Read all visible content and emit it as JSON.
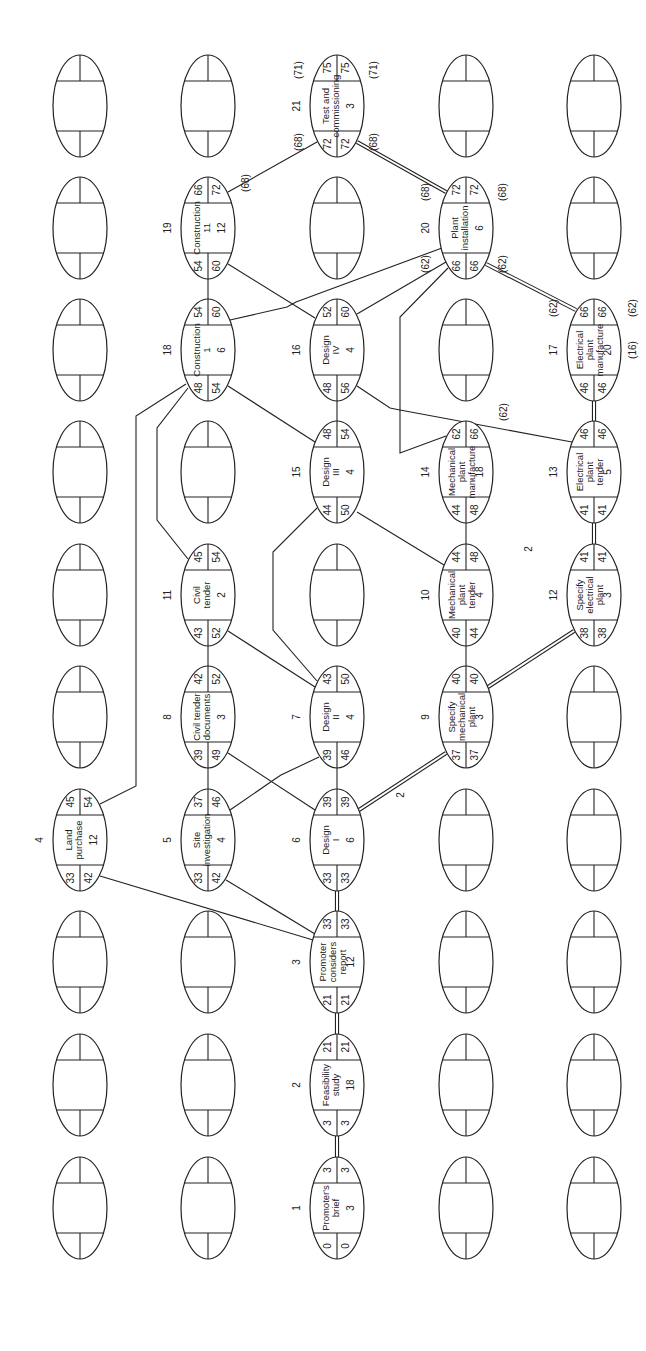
{
  "grid": {
    "columns_x": [
      80,
      208,
      337,
      466,
      594
    ],
    "rows_y": [
      106,
      228,
      350,
      472,
      595,
      717,
      840,
      962,
      1085,
      1208
    ],
    "node_rx": 27,
    "node_ry": 51
  },
  "nodes": [
    {
      "id": "1",
      "name": [
        "Promoter's",
        "brief"
      ],
      "duration": "3",
      "es": "0",
      "ls": "0",
      "ef": "3",
      "lf": "3",
      "col": 2,
      "row": 9
    },
    {
      "id": "2",
      "name": [
        "Feasibility",
        "study"
      ],
      "duration": "18",
      "es": "3",
      "ls": "3",
      "ef": "21",
      "lf": "21",
      "col": 2,
      "row": 8
    },
    {
      "id": "3",
      "name": [
        "Promoter",
        "considers",
        "report"
      ],
      "duration": "12",
      "es": "21",
      "ls": "21",
      "ef": "33",
      "lf": "33",
      "col": 2,
      "row": 7
    },
    {
      "id": "4",
      "name": [
        "Land",
        "purchase"
      ],
      "duration": "12",
      "es": "33",
      "ls": "42",
      "ef": "45",
      "lf": "54",
      "col": 0,
      "row": 6
    },
    {
      "id": "5",
      "name": [
        "Site",
        "investigation"
      ],
      "duration": "4",
      "es": "33",
      "ls": "42",
      "ef": "37",
      "lf": "46",
      "col": 1,
      "row": 6
    },
    {
      "id": "6",
      "name": [
        "Design",
        "I"
      ],
      "duration": "6",
      "es": "33",
      "ls": "33",
      "ef": "39",
      "lf": "39",
      "col": 2,
      "row": 6
    },
    {
      "id": "7",
      "name": [
        "Design",
        "II"
      ],
      "duration": "4",
      "es": "39",
      "ls": "46",
      "ef": "43",
      "lf": "50",
      "col": 2,
      "row": 5
    },
    {
      "id": "8",
      "name": [
        "Civil tender",
        "documents"
      ],
      "duration": "3",
      "es": "39",
      "ls": "49",
      "ef": "42",
      "lf": "52",
      "col": 1,
      "row": 5
    },
    {
      "id": "9",
      "name": [
        "Specify",
        "mechanical",
        "plant"
      ],
      "duration": "3",
      "es": "37",
      "ls": "37",
      "ef": "40",
      "lf": "40",
      "col": 3,
      "row": 5
    },
    {
      "id": "10",
      "name": [
        "Mechanical",
        "plant",
        "tender"
      ],
      "duration": "4",
      "es": "40",
      "ls": "44",
      "ef": "44",
      "lf": "48",
      "col": 3,
      "row": 4
    },
    {
      "id": "11",
      "name": [
        "Civil",
        "tender"
      ],
      "duration": "2",
      "es": "43",
      "ls": "52",
      "ef": "45",
      "lf": "54",
      "col": 1,
      "row": 4
    },
    {
      "id": "12",
      "name": [
        "Specify",
        "electrical",
        "plant"
      ],
      "duration": "3",
      "es": "38",
      "ls": "38",
      "ef": "41",
      "lf": "41",
      "col": 4,
      "row": 4
    },
    {
      "id": "13",
      "name": [
        "Electrical",
        "plant",
        "tender"
      ],
      "duration": "5",
      "es": "41",
      "ls": "41",
      "ef": "46",
      "lf": "46",
      "col": 4,
      "row": 3
    },
    {
      "id": "14",
      "name": [
        "Mechanical",
        "plant",
        "manufacture"
      ],
      "duration": "18",
      "es": "44",
      "ls": "48",
      "ef": "62",
      "lf": "66",
      "col": 3,
      "row": 3,
      "float_note": "(62)"
    },
    {
      "id": "15",
      "name": [
        "Design",
        "III"
      ],
      "duration": "4",
      "es": "44",
      "ls": "50",
      "ef": "48",
      "lf": "54",
      "col": 2,
      "row": 3
    },
    {
      "id": "16",
      "name": [
        "Design",
        "IV"
      ],
      "duration": "4",
      "es": "48",
      "ls": "56",
      "ef": "52",
      "lf": "60",
      "col": 2,
      "row": 2
    },
    {
      "id": "17",
      "name": [
        "Electrical",
        "plant",
        "manufacture"
      ],
      "duration": "20",
      "es": "46",
      "ls": "46",
      "ef": "66",
      "lf": "66",
      "col": 4,
      "row": 2,
      "notes": [
        "(62)",
        "(62)",
        "(16)"
      ]
    },
    {
      "id": "18",
      "name": [
        "Construction",
        "1"
      ],
      "duration": "6",
      "es": "48",
      "ls": "54",
      "ef": "54",
      "lf": "60",
      "col": 1,
      "row": 2
    },
    {
      "id": "19",
      "name": [
        "Construction",
        "11"
      ],
      "duration": "12",
      "es": "54",
      "ls": "60",
      "ef": "66",
      "lf": "72",
      "col": 1,
      "row": 1,
      "notes": [
        "(68)"
      ]
    },
    {
      "id": "20",
      "name": [
        "Plant",
        "installation"
      ],
      "duration": "6",
      "es": "66",
      "ls": "66",
      "ef": "72",
      "lf": "72",
      "col": 3,
      "row": 1,
      "notes": [
        "(62)",
        "(68)",
        "(62)",
        "(68)"
      ]
    },
    {
      "id": "21",
      "name": [
        "Test and",
        "commissioning"
      ],
      "duration": "3",
      "es": "72",
      "ls": "72",
      "ef": "75",
      "lf": "75",
      "col": 2,
      "row": 0,
      "notes": [
        "(68)",
        "(71)",
        "(68)",
        "(71)"
      ]
    }
  ],
  "edges": [
    {
      "from": "1",
      "to": "2",
      "critical": true
    },
    {
      "from": "2",
      "to": "3",
      "critical": true
    },
    {
      "from": "3",
      "to": "4",
      "critical": false
    },
    {
      "from": "3",
      "to": "5",
      "critical": false
    },
    {
      "from": "3",
      "to": "6",
      "critical": true
    },
    {
      "from": "6",
      "to": "9",
      "critical": true,
      "label": "2"
    },
    {
      "from": "6",
      "to": "7",
      "critical": false
    },
    {
      "from": "6",
      "to": "8",
      "critical": false
    },
    {
      "from": "5",
      "to": "8",
      "critical": false
    },
    {
      "from": "5",
      "to": "7",
      "critical": false
    },
    {
      "from": "8",
      "to": "11",
      "critical": false
    },
    {
      "from": "7",
      "to": "11",
      "critical": false
    },
    {
      "from": "7",
      "to": "15",
      "critical": false
    },
    {
      "from": "9",
      "to": "10",
      "critical": false
    },
    {
      "from": "9",
      "to": "12",
      "critical": true,
      "label": "2"
    },
    {
      "from": "10",
      "to": "14",
      "critical": false
    },
    {
      "from": "15",
      "to": "10",
      "critical": false
    },
    {
      "from": "12",
      "to": "13",
      "critical": true
    },
    {
      "from": "13",
      "to": "17",
      "critical": true
    },
    {
      "from": "15",
      "to": "16",
      "critical": false
    },
    {
      "from": "15",
      "to": "18",
      "critical": false
    },
    {
      "from": "11",
      "to": "18",
      "critical": false
    },
    {
      "from": "4",
      "to": "18",
      "critical": false
    },
    {
      "from": "16",
      "to": "13",
      "critical": false
    },
    {
      "from": "16",
      "to": "19",
      "critical": false
    },
    {
      "from": "16",
      "to": "20",
      "critical": false
    },
    {
      "from": "18",
      "to": "19",
      "critical": false
    },
    {
      "from": "18",
      "to": "20",
      "critical": false
    },
    {
      "from": "14",
      "to": "20",
      "critical": false
    },
    {
      "from": "17",
      "to": "20",
      "critical": true
    },
    {
      "from": "19",
      "to": "21",
      "critical": false
    },
    {
      "from": "20",
      "to": "21",
      "critical": true
    }
  ],
  "edge_labels": [
    {
      "text": "2",
      "x": 401,
      "y": 795
    },
    {
      "text": "2",
      "x": 529,
      "y": 549
    }
  ],
  "texts": {
    "n1_id": "1",
    "n2_id": "2",
    "n3_id": "3",
    "n4_id": "4",
    "n5_id": "5",
    "n6_id": "6",
    "n7_id": "7",
    "n8_id": "8",
    "n9_id": "9",
    "n10_id": "10",
    "n11_id": "11",
    "n12_id": "12",
    "n13_id": "13",
    "n14_id": "14",
    "n15_id": "15",
    "n16_id": "16",
    "n17_id": "17",
    "n18_id": "18",
    "n19_id": "19",
    "n20_id": "20",
    "n21_id": "21"
  }
}
